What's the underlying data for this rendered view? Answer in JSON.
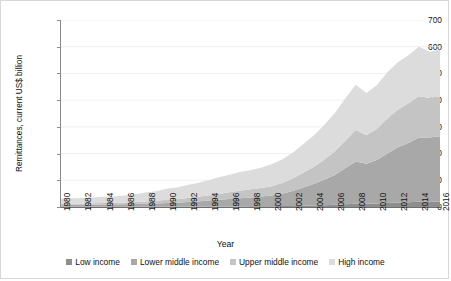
{
  "chart_data": {
    "type": "area",
    "title": "",
    "xlabel": "Year",
    "ylabel": "Remittances, current US$ billion",
    "ylim": [
      0,
      700
    ],
    "yticks": [
      0,
      100,
      200,
      300,
      400,
      500,
      600,
      700
    ],
    "grid": true,
    "legend_position": "bottom",
    "stacked": true,
    "x": [
      1980,
      1981,
      1982,
      1983,
      1984,
      1985,
      1986,
      1987,
      1988,
      1989,
      1990,
      1991,
      1992,
      1993,
      1994,
      1995,
      1996,
      1997,
      1998,
      1999,
      2000,
      2001,
      2002,
      2003,
      2004,
      2005,
      2006,
      2007,
      2008,
      2009,
      2010,
      2011,
      2012,
      2013,
      2014,
      2015,
      2016
    ],
    "xtick_labels": [
      "1980",
      "1982",
      "1984",
      "1986",
      "1988",
      "1990",
      "1992",
      "1994",
      "1996",
      "1998",
      "2000",
      "2002",
      "2004",
      "2006",
      "2008",
      "2010",
      "2012",
      "2014",
      "2016"
    ],
    "series": [
      {
        "name": "Low income",
        "color": "#8e8e8e",
        "values": [
          1,
          1,
          1,
          1,
          1,
          1,
          1,
          1,
          1,
          1,
          1,
          1,
          2,
          2,
          2,
          2,
          2,
          2,
          3,
          3,
          3,
          4,
          4,
          5,
          6,
          7,
          8,
          10,
          12,
          12,
          13,
          15,
          17,
          18,
          20,
          20,
          20
        ]
      },
      {
        "name": "Lower middle income",
        "color": "#a8a8a8",
        "values": [
          6,
          7,
          7,
          7,
          8,
          8,
          9,
          10,
          11,
          12,
          14,
          15,
          17,
          19,
          22,
          25,
          28,
          31,
          33,
          36,
          40,
          46,
          56,
          68,
          80,
          95,
          112,
          135,
          158,
          150,
          163,
          185,
          207,
          222,
          240,
          240,
          245
        ]
      },
      {
        "name": "Upper middle income",
        "color": "#c4c4c4",
        "values": [
          5,
          5,
          5,
          6,
          6,
          6,
          7,
          8,
          9,
          10,
          12,
          13,
          15,
          17,
          19,
          22,
          25,
          28,
          30,
          32,
          35,
          40,
          47,
          55,
          64,
          75,
          88,
          103,
          118,
          107,
          116,
          131,
          140,
          148,
          155,
          148,
          150
        ]
      },
      {
        "name": "High income",
        "color": "#dcdcdc",
        "values": [
          19,
          20,
          21,
          22,
          23,
          24,
          26,
          29,
          33,
          36,
          41,
          44,
          48,
          52,
          57,
          62,
          66,
          70,
          72,
          76,
          82,
          88,
          96,
          107,
          118,
          130,
          143,
          158,
          170,
          158,
          164,
          173,
          178,
          180,
          185,
          173,
          175
        ]
      }
    ],
    "annotations": []
  },
  "legend": {
    "items": [
      {
        "label": "Low income",
        "color": "#8e8e8e"
      },
      {
        "label": "Lower middle income",
        "color": "#a8a8a8"
      },
      {
        "label": "Upper middle income",
        "color": "#c4c4c4"
      },
      {
        "label": "High income",
        "color": "#dcdcdc"
      }
    ]
  }
}
